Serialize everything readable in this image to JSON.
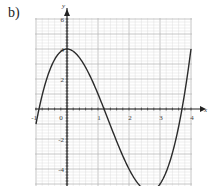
{
  "question_label": "b)",
  "chart_data": {
    "type": "line",
    "title": "",
    "xlabel": "x",
    "ylabel": "y",
    "xlim": [
      -1,
      4
    ],
    "ylim": [
      -5,
      6
    ],
    "x_ticks": [
      -1,
      0,
      1,
      2,
      3,
      4
    ],
    "x_tick_labels": [
      "-1",
      "0",
      "1",
      "2",
      "3",
      "4"
    ],
    "y_ticks": [
      6,
      4,
      2,
      -2,
      -4
    ],
    "y_tick_labels": [
      "6",
      "4",
      "2",
      "-2",
      "-4"
    ],
    "grid": true,
    "minor_grid_step": 0.2,
    "function": "y = x^3 - 4x^2 + 4",
    "series": [
      {
        "name": "curve",
        "x": [
          -1,
          -0.5,
          0,
          0.5,
          1,
          1.5,
          2,
          2.5,
          3,
          3.5,
          4
        ],
        "y": [
          -1,
          2.875,
          4,
          3.125,
          1,
          -1.625,
          -4,
          -5.375,
          -5,
          -2.125,
          4
        ]
      }
    ],
    "colors": {
      "curve": "#2b2b2b",
      "major_grid": "#b8b8b8",
      "minor_grid": "#dedede",
      "axis": "#222222"
    }
  }
}
